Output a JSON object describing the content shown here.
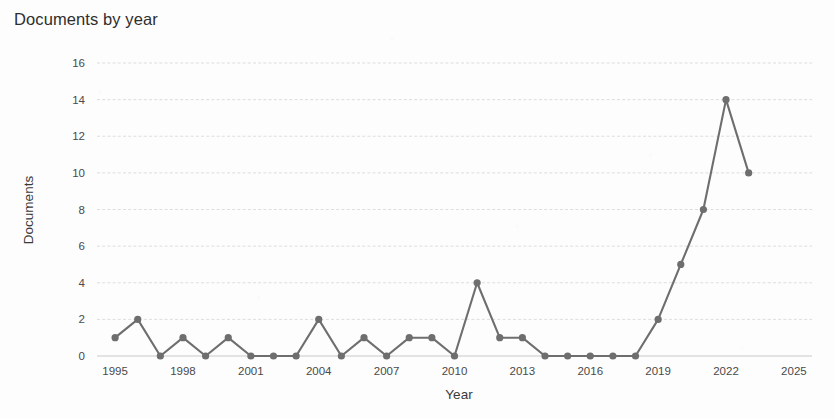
{
  "chart_data": {
    "type": "line",
    "title": "Documents by year",
    "xlabel": "Year",
    "ylabel": "Documents",
    "grid": true,
    "legend": "none",
    "xlim": [
      1994.2,
      2025.8
    ],
    "ylim": [
      0,
      16
    ],
    "xticks": [
      1995,
      1998,
      2001,
      2004,
      2007,
      2010,
      2013,
      2016,
      2019,
      2022,
      2025
    ],
    "yticks": [
      0,
      2,
      4,
      6,
      8,
      10,
      12,
      14,
      16
    ],
    "x": [
      1995,
      1996,
      1997,
      1998,
      1999,
      2000,
      2001,
      2002,
      2003,
      2004,
      2005,
      2006,
      2007,
      2008,
      2009,
      2010,
      2011,
      2012,
      2013,
      2014,
      2015,
      2016,
      2017,
      2018,
      2019,
      2020,
      2021,
      2022,
      2023
    ],
    "values": [
      1,
      2,
      0,
      1,
      0,
      1,
      0,
      0,
      0,
      2,
      0,
      1,
      0,
      1,
      1,
      0,
      4,
      1,
      1,
      0,
      0,
      0,
      0,
      0,
      2,
      5,
      8,
      14,
      10
    ],
    "series": [
      {
        "name": "Documents",
        "color": "#6e6e6e",
        "values": [
          1,
          2,
          0,
          1,
          0,
          1,
          0,
          0,
          0,
          2,
          0,
          1,
          0,
          1,
          1,
          0,
          4,
          1,
          1,
          0,
          0,
          0,
          0,
          0,
          2,
          5,
          8,
          14,
          10
        ]
      }
    ]
  },
  "colors": {
    "line": "#6e6e6e",
    "marker": "#6e6e6e",
    "grid": "#d9d9d9",
    "text": "#4a4a4a",
    "title": "#2e2e2e",
    "background": "#fdfdfd"
  }
}
